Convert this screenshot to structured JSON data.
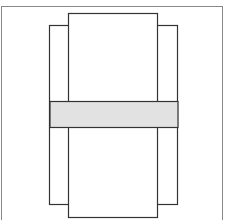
{
  "diagram": {
    "type": "box-net",
    "colors": {
      "stroke": "#333333",
      "frame": "#888888",
      "band_fill": "#e2e2e2",
      "background": "#ffffff"
    },
    "frame": {
      "x": 1.5,
      "y": 6.5,
      "w": 221,
      "h": 220
    },
    "center_panel": {
      "x": 68.5,
      "y": 13.5,
      "w": 89,
      "h": 204
    },
    "side_panels": {
      "x": 49.5,
      "y": 25.5,
      "w": 128,
      "h": 179
    },
    "fold_lines": [
      {
        "x": 68.5,
        "y1": 25,
        "y2": 205
      },
      {
        "x": 157.5,
        "y1": 25,
        "y2": 205
      }
    ],
    "band": {
      "x": 50,
      "y": 101.5,
      "w": 128,
      "h": 26
    }
  }
}
